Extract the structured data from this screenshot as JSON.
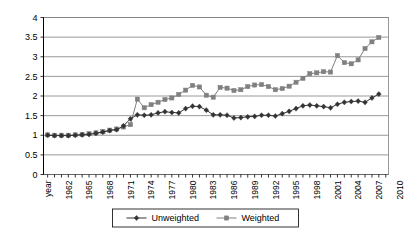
{
  "chart_data": {
    "type": "line",
    "title": "",
    "xlabel": "",
    "ylabel": "",
    "ylim": [
      0,
      4
    ],
    "ytick_labels": [
      "0",
      "0.5",
      "1",
      "1.5",
      "2",
      "2.5",
      "3",
      "3.5",
      "4"
    ],
    "ytick_values": [
      0,
      0.5,
      1,
      1.5,
      2,
      2.5,
      3,
      3.5,
      4
    ],
    "grid": true,
    "legend_position": "bottom",
    "x_axis_first_label": "year",
    "xtick_labels": [
      "year",
      "1962",
      "1965",
      "1968",
      "1971",
      "1974",
      "1977",
      "1980",
      "1983",
      "1986",
      "1989",
      "1992",
      "1995",
      "1998",
      "2001",
      "2004",
      "2007",
      "2010"
    ],
    "x": [
      1961,
      1962,
      1963,
      1964,
      1965,
      1966,
      1967,
      1968,
      1969,
      1970,
      1971,
      1972,
      1973,
      1974,
      1975,
      1976,
      1977,
      1978,
      1979,
      1980,
      1981,
      1982,
      1983,
      1984,
      1985,
      1986,
      1987,
      1988,
      1989,
      1990,
      1991,
      1992,
      1993,
      1994,
      1995,
      1996,
      1997,
      1998,
      1999,
      2000,
      2001,
      2002,
      2003,
      2004,
      2005,
      2006,
      2007,
      2008,
      2009
    ],
    "series": [
      {
        "name": "Unweighted",
        "color": "#333333",
        "marker": "diamond",
        "values": [
          1.0,
          0.99,
          0.99,
          0.99,
          1.0,
          1.01,
          1.02,
          1.05,
          1.08,
          1.12,
          1.14,
          1.24,
          1.42,
          1.52,
          1.51,
          1.52,
          1.57,
          1.6,
          1.58,
          1.57,
          1.68,
          1.74,
          1.73,
          1.64,
          1.52,
          1.52,
          1.51,
          1.44,
          1.45,
          1.47,
          1.48,
          1.51,
          1.51,
          1.49,
          1.55,
          1.61,
          1.68,
          1.75,
          1.77,
          1.75,
          1.73,
          1.7,
          1.79,
          1.84,
          1.86,
          1.87,
          1.84,
          1.95,
          2.05
        ]
      },
      {
        "name": "Weighted",
        "color": "#808080",
        "marker": "square",
        "values": [
          1.01,
          1.0,
          1.0,
          1.0,
          1.01,
          1.02,
          1.04,
          1.06,
          1.09,
          1.13,
          1.16,
          1.21,
          1.27,
          1.92,
          1.7,
          1.78,
          1.84,
          1.91,
          1.95,
          2.04,
          2.15,
          2.27,
          2.23,
          2.02,
          1.97,
          2.22,
          2.2,
          2.14,
          2.16,
          2.24,
          2.28,
          2.29,
          2.24,
          2.16,
          2.19,
          2.25,
          2.35,
          2.45,
          2.57,
          2.59,
          2.62,
          2.61,
          3.03,
          2.85,
          2.82,
          2.92,
          3.21,
          3.38,
          3.49
        ]
      }
    ],
    "extra_weighted_tail": {
      "note_years": [
        2006,
        2007,
        2008,
        2009
      ],
      "values": [
        3.5,
        3.63,
        2.85,
        3.28
      ]
    }
  },
  "legend": {
    "items": [
      {
        "label": "Unweighted",
        "marker": "diamond",
        "color": "#333333"
      },
      {
        "label": "Weighted",
        "marker": "square",
        "color": "#808080"
      }
    ]
  }
}
